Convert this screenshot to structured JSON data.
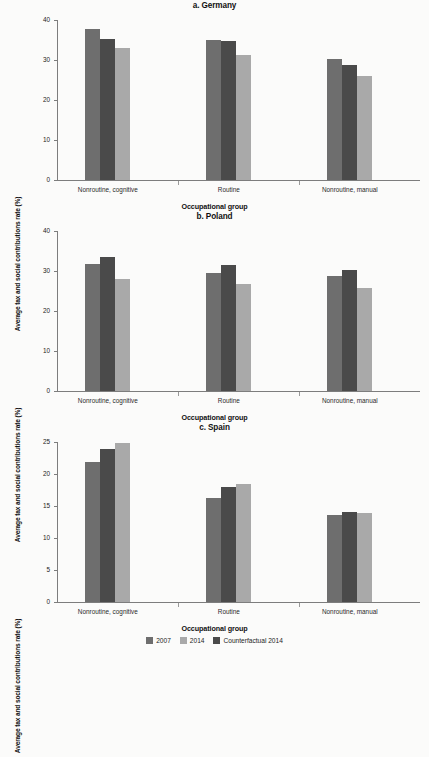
{
  "figure": {
    "background": "#fbfbfa",
    "xlabel": "Occupational group",
    "ylabel": "Average tax and social contributions rate (%)"
  },
  "legend": {
    "position": "bottom-center",
    "items": [
      {
        "label": "2007",
        "color": "#6e6e6e"
      },
      {
        "label": "2014",
        "color": "#a9a9a9"
      },
      {
        "label": "Counterfactual  2014",
        "color": "#4a4a4a"
      }
    ]
  },
  "chart_data": [
    {
      "type": "bar",
      "title": "a. Germany",
      "xlabel": "Occupational group",
      "ylabel": "Average tax and social contributions rate (%)",
      "categories": [
        "Nonroutine, cognitive",
        "Routine",
        "Nonroutine, manual"
      ],
      "ylim": [
        0,
        40
      ],
      "yticks": [
        0,
        10,
        20,
        30,
        40
      ],
      "grid": false,
      "series": [
        {
          "name": "2007",
          "color": "#6e6e6e",
          "values": [
            37.7,
            35.1,
            30.2
          ]
        },
        {
          "name": "Counterfactual  2014",
          "color": "#4a4a4a",
          "values": [
            35.3,
            34.7,
            28.8
          ]
        },
        {
          "name": "2014",
          "color": "#a9a9a9",
          "values": [
            33.0,
            31.3,
            26.0
          ]
        }
      ]
    },
    {
      "type": "bar",
      "title": "b. Poland",
      "xlabel": "Occupational group",
      "ylabel": "Average tax and social contributions rate (%)",
      "categories": [
        "Nonroutine, cognitive",
        "Routine",
        "Nonroutine, manual"
      ],
      "ylim": [
        0,
        40
      ],
      "yticks": [
        0,
        10,
        20,
        30,
        40
      ],
      "grid": false,
      "series": [
        {
          "name": "2007",
          "color": "#6e6e6e",
          "values": [
            31.8,
            29.5,
            28.7
          ]
        },
        {
          "name": "Counterfactual  2014",
          "color": "#4a4a4a",
          "values": [
            33.4,
            31.4,
            30.2
          ]
        },
        {
          "name": "2014",
          "color": "#a9a9a9",
          "values": [
            27.9,
            26.8,
            25.8
          ]
        }
      ]
    },
    {
      "type": "bar",
      "title": "c. Spain",
      "xlabel": "Occupational group",
      "ylabel": "Average tax and social contributions rate (%)",
      "categories": [
        "Nonroutine, cognitive",
        "Routine",
        "Nonroutine, manual"
      ],
      "ylim": [
        0,
        25
      ],
      "yticks": [
        0,
        5,
        10,
        15,
        20,
        25
      ],
      "grid": false,
      "series": [
        {
          "name": "2007",
          "color": "#6e6e6e",
          "values": [
            21.8,
            16.3,
            13.6
          ]
        },
        {
          "name": "Counterfactual  2014",
          "color": "#4a4a4a",
          "values": [
            23.9,
            18.0,
            14.0
          ]
        },
        {
          "name": "2014",
          "color": "#a9a9a9",
          "values": [
            24.9,
            18.4,
            13.9
          ]
        }
      ]
    }
  ]
}
